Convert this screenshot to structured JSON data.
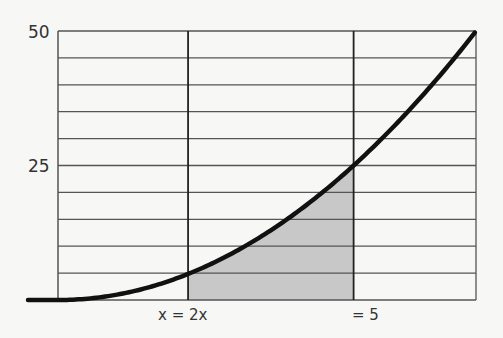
{
  "chart_data": {
    "type": "line",
    "title": "",
    "xlabel": "",
    "ylabel": "",
    "function": "y = x^2",
    "ylim": [
      0,
      50
    ],
    "xlim": [
      0,
      7.07
    ],
    "y_ticks": [
      {
        "value": 50,
        "label": "50"
      },
      {
        "value": 25,
        "label": "25"
      }
    ],
    "y_grid_step": 5,
    "x_markers": [
      {
        "value": 2.2,
        "label": "x = 2x"
      },
      {
        "value": 5,
        "label": "= 5"
      }
    ],
    "series": [
      {
        "name": "curve",
        "x": [
          -0.9,
          0,
          0.5,
          1,
          1.5,
          2,
          2.2,
          2.5,
          3,
          3.5,
          4,
          4.5,
          5,
          5.5,
          6,
          6.5,
          7.07
        ],
        "values": [
          0,
          0,
          0.25,
          1,
          2.25,
          4,
          4.84,
          6.25,
          9,
          12.25,
          16,
          20.25,
          25,
          30.25,
          36,
          42.25,
          50
        ]
      }
    ],
    "shaded_region": {
      "from_x": 2.2,
      "to_x": 5,
      "under": "curve",
      "color": "#c8c8c8"
    },
    "grid": true,
    "colors": {
      "curve": "#111111",
      "grid": "#555555",
      "shade": "#c8c8c8",
      "background": "#f7f7f5"
    }
  },
  "labels": {
    "y50": "50",
    "y25": "25",
    "x_left": "x = 2x",
    "x_right": "= 5"
  }
}
